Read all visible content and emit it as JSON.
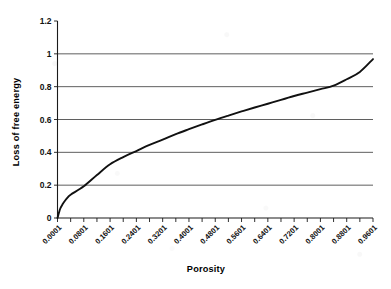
{
  "chart_data": {
    "type": "line",
    "title": "",
    "xlabel": "Porosity",
    "ylabel": "Loss of free energy",
    "xlim": [
      0.0001,
      0.9601
    ],
    "ylim": [
      0,
      1.2
    ],
    "grid": true,
    "legend": false,
    "y_ticks": [
      "0",
      "0.2",
      "0.4",
      "0.6",
      "0.8",
      "1",
      "1.2"
    ],
    "y_tick_values": [
      0,
      0.2,
      0.4,
      0.6,
      0.8,
      1,
      1.2
    ],
    "categories": [
      "0.0001",
      "0.0801",
      "0.1601",
      "0.2401",
      "0.3201",
      "0.4001",
      "0.4801",
      "0.5601",
      "0.6401",
      "0.7201",
      "0.8001",
      "0.8801",
      "0.9601"
    ],
    "x": [
      0.0001,
      0.0801,
      0.1601,
      0.2401,
      0.3201,
      0.4001,
      0.4801,
      0.5601,
      0.6401,
      0.7201,
      0.8001,
      0.8801,
      0.9601
    ],
    "series": [
      {
        "name": "Loss of free energy",
        "color": "#111111",
        "x": [
          0.0001,
          0.008,
          0.016,
          0.024,
          0.032,
          0.04,
          0.0801,
          0.1201,
          0.1601,
          0.2001,
          0.2401,
          0.2801,
          0.3201,
          0.3601,
          0.4001,
          0.4401,
          0.4801,
          0.5201,
          0.5601,
          0.6001,
          0.6401,
          0.6801,
          0.7201,
          0.7601,
          0.8001,
          0.8401,
          0.8801,
          0.9201,
          0.9601
        ],
        "values": [
          0.0,
          0.055,
          0.085,
          0.108,
          0.127,
          0.142,
          0.193,
          0.262,
          0.327,
          0.371,
          0.408,
          0.445,
          0.477,
          0.511,
          0.541,
          0.57,
          0.598,
          0.624,
          0.649,
          0.673,
          0.696,
          0.72,
          0.743,
          0.764,
          0.785,
          0.806,
          0.845,
          0.89,
          0.968
        ]
      }
    ]
  },
  "axes": {
    "y_axis_title": "Loss of free energy",
    "x_axis_title": "Porosity"
  }
}
